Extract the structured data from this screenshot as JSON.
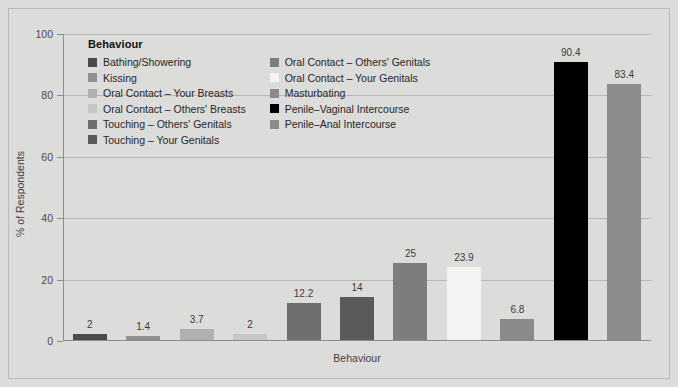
{
  "chart_data": {
    "type": "bar",
    "title": "",
    "xlabel": "Behaviour",
    "ylabel": "% of Respondents",
    "ylim": [
      0,
      100
    ],
    "yticks": [
      0,
      20,
      40,
      60,
      80,
      100
    ],
    "grid": true,
    "legend_position": "inside-top-left",
    "legend_title": "Behaviour",
    "categories": [
      "Bathing/Showering",
      "Kissing",
      "Oral Contact – Your Breasts",
      "Oral Contact – Others' Breasts",
      "Touching – Others' Genitals",
      "Touching – Your Genitals",
      "Oral Contact – Others' Genitals",
      "Oral Contact – Your Genitals",
      "Masturbating",
      "Penile–Vaginal Intercourse",
      "Penile–Anal Intercourse"
    ],
    "values": [
      2,
      1.4,
      3.7,
      2,
      12.2,
      14,
      25,
      23.9,
      6.8,
      90.4,
      83.4
    ],
    "value_labels": [
      "2",
      "1.4",
      "3.7",
      "2",
      "12.2",
      "14",
      "25",
      "23.9",
      "6.8",
      "90.4",
      "83.4"
    ],
    "colors": [
      "#4b4b4b",
      "#8f8f8f",
      "#b0b0b0",
      "#c6c6c4",
      "#6f6f6f",
      "#5a5a5a",
      "#7d7d7d",
      "#f4f4f2",
      "#8a8a8a",
      "#000000",
      "#8b8b8b"
    ]
  },
  "legend": {
    "title": "Behaviour",
    "columns": [
      [
        {
          "label": "Bathing/Showering",
          "color": "#4b4b4b"
        },
        {
          "label": "Kissing",
          "color": "#8f8f8f"
        },
        {
          "label": "Oral Contact – Your Breasts",
          "color": "#b0b0b0"
        },
        {
          "label": "Oral Contact – Others' Breasts",
          "color": "#c6c6c4"
        },
        {
          "label": "Touching – Others' Genitals",
          "color": "#6f6f6f"
        },
        {
          "label": "Touching – Your Genitals",
          "color": "#5a5a5a"
        }
      ],
      [
        {
          "label": "Oral Contact – Others' Genitals",
          "color": "#7d7d7d"
        },
        {
          "label": "Oral Contact – Your Genitals",
          "color": "#f4f4f2"
        },
        {
          "label": "Masturbating",
          "color": "#8a8a8a"
        },
        {
          "label": "Penile–Vaginal Intercourse",
          "color": "#000000"
        },
        {
          "label": "Penile–Anal Intercourse",
          "color": "#8b8b8b"
        }
      ]
    ]
  },
  "axes": {
    "y_tick_labels": [
      "100",
      "80",
      "60",
      "40",
      "20",
      "0"
    ],
    "y_axis_title": "% of Respondents",
    "x_axis_title": "Behaviour"
  },
  "style": {
    "background": "#dcdcda",
    "gridline_color": "#b6b6b4",
    "axis_color": "#8d8d8b",
    "text_color": "#3b3b3b"
  }
}
